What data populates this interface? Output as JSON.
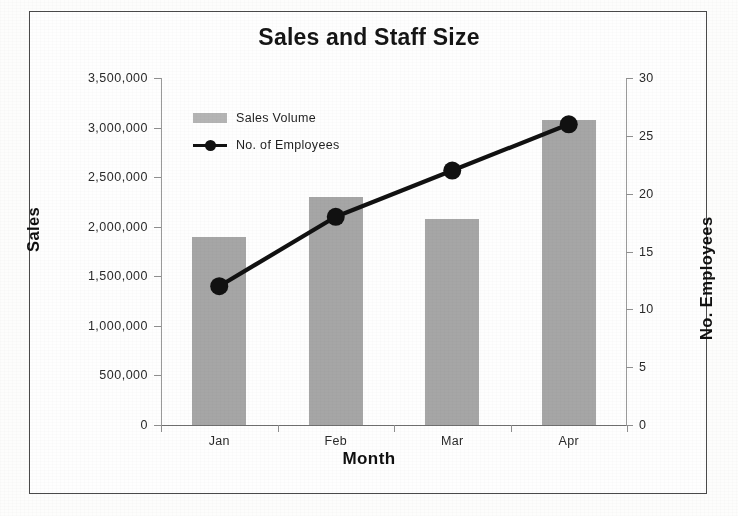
{
  "chart_data": {
    "type": "bar",
    "title": "Sales and Staff Size",
    "xlabel": "Month",
    "ylabel": "Sales",
    "y2label": "No. Employees",
    "categories": [
      "Jan",
      "Feb",
      "Mar",
      "Apr"
    ],
    "ylim": [
      0,
      3500000
    ],
    "y2lim": [
      0,
      30
    ],
    "ytick_labels": [
      "0",
      "500,000",
      "1,000,000",
      "1,500,000",
      "2,000,000",
      "2,500,000",
      "3,000,000",
      "3,500,000"
    ],
    "ytick_values": [
      0,
      500000,
      1000000,
      1500000,
      2000000,
      2500000,
      3000000,
      3500000
    ],
    "y2tick_labels": [
      "0",
      "5",
      "10",
      "15",
      "20",
      "25",
      "30"
    ],
    "y2tick_values": [
      0,
      5,
      10,
      15,
      20,
      25,
      30
    ],
    "grid": false,
    "legend_position": "inside-top-left",
    "series": [
      {
        "name": "Sales Volume",
        "kind": "bar",
        "axis": "left",
        "color": "#a6a6a6",
        "values": [
          1900000,
          2300000,
          2080000,
          3080000
        ]
      },
      {
        "name": "No. of Employees",
        "kind": "line",
        "axis": "right",
        "color": "#111111",
        "marker": "circle",
        "values": [
          12,
          18,
          22,
          26
        ]
      }
    ]
  },
  "legend": {
    "items": [
      {
        "label": "Sales Volume",
        "swatch": "bar"
      },
      {
        "label": "No. of Employees",
        "swatch": "line"
      }
    ]
  },
  "colors": {
    "bar_fill": "#a6a6a6",
    "line": "#111111",
    "axis": "#8f8f8f",
    "frame_border": "#4a4a4a",
    "background": "#fefefe",
    "text": "#1d1d1d"
  }
}
